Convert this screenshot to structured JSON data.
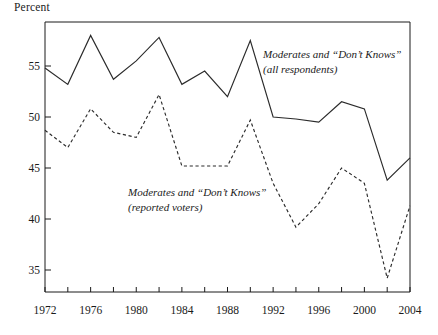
{
  "chart_data": {
    "type": "line",
    "title": "",
    "subtitle": "",
    "xlabel": "",
    "ylabel": "Percent",
    "xlim": [
      1972,
      2004
    ],
    "ylim": [
      32.5,
      59.5
    ],
    "grid": false,
    "legend_position": "inline-annotations",
    "y_ticks": [
      35,
      40,
      45,
      50,
      55
    ],
    "y_tick_labels": [
      "35",
      "40",
      "45",
      "50",
      "55"
    ],
    "x_ticks": [
      1972,
      1974,
      1976,
      1978,
      1980,
      1982,
      1984,
      1986,
      1988,
      1990,
      1992,
      1994,
      1996,
      1998,
      2000,
      2002,
      2004
    ],
    "x_tick_labels": [
      "1972",
      "",
      "1976",
      "",
      "1980",
      "",
      "1984",
      "",
      "1988",
      "",
      "1992",
      "",
      "1996",
      "",
      "2000",
      "",
      "2004"
    ],
    "x_major_labels": [
      "1972",
      "1976",
      "1980",
      "1984",
      "1988",
      "1992",
      "1996",
      "2000",
      "2004"
    ],
    "x": [
      1972,
      1974,
      1976,
      1978,
      1980,
      1982,
      1984,
      1986,
      1988,
      1990,
      1992,
      1994,
      1996,
      1998,
      2000,
      2002,
      2004
    ],
    "series": [
      {
        "name": "Moderates and “Don’t Knows” (all respondents)",
        "style": "solid",
        "color": "#2b2b2b",
        "values": [
          54.8,
          53.2,
          58.0,
          53.7,
          55.5,
          57.8,
          53.2,
          54.5,
          52.0,
          57.5,
          50.0,
          49.8,
          49.5,
          51.5,
          50.8,
          43.8,
          46.0
        ]
      },
      {
        "name": "Moderates and “Don’t Knows” (reported voters)",
        "style": "dashed",
        "color": "#2b2b2b",
        "values": [
          48.7,
          47.0,
          50.8,
          48.5,
          48.0,
          52.2,
          45.2,
          45.2,
          45.2,
          49.7,
          43.5,
          39.2,
          41.5,
          45.0,
          43.5,
          34.2,
          41.3
        ]
      }
    ],
    "annotations": [
      {
        "id": "annotation-all-respondents",
        "line1": "Moderates and “Don’t Knows”",
        "line2": "(all respondents)",
        "x_px": 263,
        "y_px": 58
      },
      {
        "id": "annotation-reported-voters",
        "line1": "Moderates and “Don’t Knows”",
        "line2": "(reported voters)",
        "x_px": 128,
        "y_px": 196
      }
    ]
  },
  "axes": {
    "y_title": "Percent"
  }
}
